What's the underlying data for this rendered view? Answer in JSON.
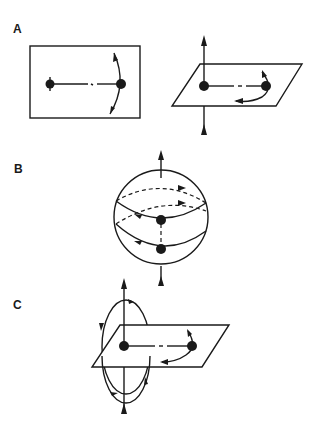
{
  "panels": [
    {
      "label": "A",
      "description": "Two rotation views: planar rectangle with two linked particles and arcs; tilted plane with vertical axis and rotation arrow"
    },
    {
      "label": "B",
      "description": "Sphere with vertical axis, two latitude circles with directional arrows, two particles on front meridian"
    },
    {
      "label": "C",
      "description": "Tilted plane with vertical axis, two linked particles, and vertical elliptical orbit with arrows"
    }
  ],
  "colors": {
    "ink": "#1a1a1a",
    "background": "#ffffff"
  }
}
